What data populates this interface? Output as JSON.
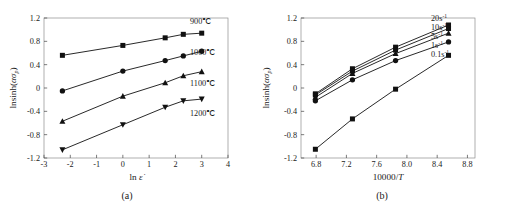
{
  "figure": {
    "panels": [
      {
        "id": "a",
        "caption": "(a)",
        "chart_index": 0
      },
      {
        "id": "b",
        "caption": "(b)",
        "chart_index": 1
      }
    ]
  },
  "chart_data": [
    {
      "type": "line",
      "panel": "(a)",
      "title": "",
      "xlabel": "ln ε̇",
      "ylabel": "lnsinh(ασp)",
      "xlim": [
        -3,
        4
      ],
      "ylim": [
        -1.2,
        1.2
      ],
      "xticks": [
        -3,
        -2,
        -1,
        0,
        1,
        2,
        3,
        4
      ],
      "xticklabels": [
        "-3",
        "-2",
        "-1",
        "0",
        "1",
        "2",
        "3",
        "4"
      ],
      "yticks": [
        -1.2,
        -0.8,
        -0.4,
        0,
        0.4,
        0.8,
        1.2
      ],
      "yticklabels": [
        "-1.2",
        "-0.8",
        "-0.4",
        "0",
        "0.4",
        "0.8",
        "1.2"
      ],
      "grid": false,
      "legend_position": "right-inline",
      "x": [
        -2.3,
        0.0,
        1.61,
        2.3,
        3.0
      ],
      "series": [
        {
          "name": "900℃",
          "marker": "square",
          "values": [
            0.56,
            0.73,
            0.86,
            0.92,
            0.94
          ]
        },
        {
          "name": "1000℃",
          "marker": "circle",
          "values": [
            -0.05,
            0.29,
            0.47,
            0.55,
            0.63
          ]
        },
        {
          "name": "1100℃",
          "marker": "triangle-up",
          "values": [
            -0.57,
            -0.14,
            0.09,
            0.21,
            0.28
          ]
        },
        {
          "name": "1200℃",
          "marker": "triangle-down",
          "values": [
            -1.06,
            -0.63,
            -0.33,
            -0.22,
            -0.19
          ]
        }
      ]
    },
    {
      "type": "line",
      "panel": "(b)",
      "title": "",
      "xlabel": "10000/T",
      "ylabel": "lnsinh(ασp)",
      "xlim": [
        6.6,
        8.9
      ],
      "ylim": [
        -1.2,
        1.2
      ],
      "xticks": [
        6.8,
        7.2,
        7.6,
        8.0,
        8.4,
        8.8
      ],
      "xticklabels": [
        "6.8",
        "7.2",
        "7.6",
        "8.0",
        "8.4",
        "8.8"
      ],
      "yticks": [
        -1.2,
        -0.8,
        -0.4,
        0,
        0.4,
        0.8,
        1.2
      ],
      "yticklabels": [
        "-1.2",
        "-0.8",
        "-0.4",
        "0",
        "0.4",
        "0.8",
        "1.2"
      ],
      "grid": false,
      "legend_position": "right-inline",
      "x": [
        6.79,
        7.28,
        7.85,
        8.55
      ],
      "series": [
        {
          "name": "20s⁻¹",
          "marker": "square",
          "values": [
            -0.1,
            0.33,
            0.7,
            1.08
          ]
        },
        {
          "name": "10s⁻¹",
          "marker": "square",
          "values": [
            -0.12,
            0.29,
            0.65,
            1.02
          ]
        },
        {
          "name": "5s⁻¹",
          "marker": "triangle-up",
          "values": [
            -0.16,
            0.25,
            0.59,
            0.94
          ]
        },
        {
          "name": "1s⁻¹",
          "marker": "circle",
          "values": [
            -0.22,
            0.14,
            0.47,
            0.79
          ]
        },
        {
          "name": "0.1s⁻¹",
          "marker": "square",
          "values": [
            -1.05,
            -0.53,
            -0.02,
            0.56
          ]
        }
      ]
    }
  ]
}
